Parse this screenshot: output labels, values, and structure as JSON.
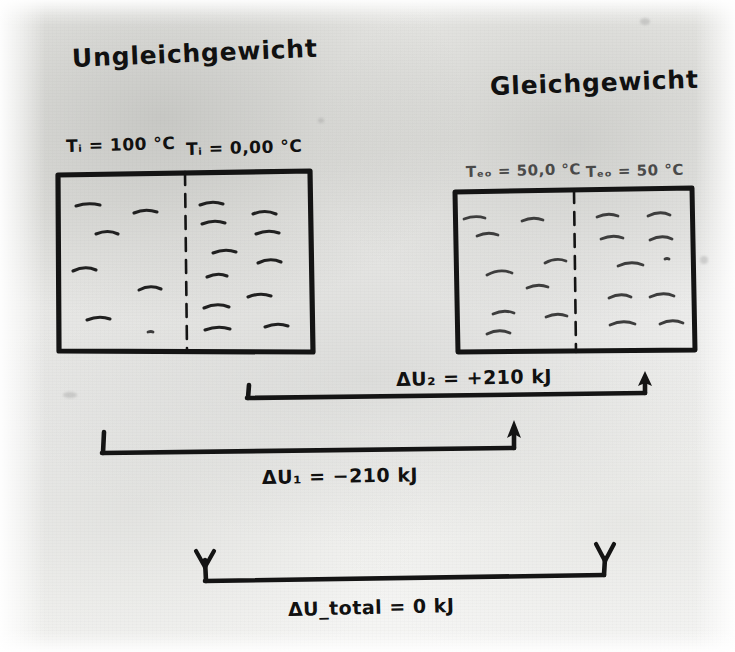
{
  "document": {
    "kind": "handwritten-diagram",
    "language": "de",
    "medium": "scanned pencil-and-pen sketch on grey paper"
  },
  "headings": {
    "left": "Ungleichgewicht",
    "right": "Gleichgewicht"
  },
  "boxes": {
    "left": {
      "name": "non-equilibrium-box",
      "left_half": {
        "temperature_label": "Tᵢ = 100 °C",
        "particle_count": 6,
        "density": "low"
      },
      "right_half": {
        "temperature_label": "Tᵢ = 0,00 °C",
        "particle_count": 11,
        "density": "high"
      },
      "divider": "dashed"
    },
    "right": {
      "name": "equilibrium-box",
      "left_half": {
        "temperature_label": "Tₑₒ = 50,0 °C",
        "particle_count": 9,
        "density": "medium"
      },
      "right_half": {
        "temperature_label": "Tₑₒ = 50 °C",
        "particle_count": 9,
        "density": "medium"
      },
      "divider": "dashed"
    }
  },
  "temperatures": {
    "left_box_left_half": "T",
    "left_box_left_half_sub": "i",
    "left_box_left_half_value": " = 100 ",
    "left_box_left_half_unit": "°C",
    "left_box_right_half_value": " = 0,00 ",
    "right_box_left_half_sub": "eq",
    "right_box_left_half_value": " = 50,0 ",
    "right_box_right_half_value": " = 50 "
  },
  "arrows": [
    {
      "id": "delta-u2",
      "label_delta": "ΔU",
      "label_sub": "2",
      "label_value": " = +210 kJ",
      "full_label": "ΔU₂ = +210 kJ",
      "value": 210,
      "unit": "kJ",
      "sign": "+",
      "direction": "left-to-right",
      "head": "up-arrow-right-end",
      "meaning": "energy gained by the cold subsystem"
    },
    {
      "id": "delta-u1",
      "label_delta": "ΔU",
      "label_sub": "1",
      "label_value": " = −210 kJ",
      "full_label": "ΔU₁ = −210 kJ",
      "value": -210,
      "unit": "kJ",
      "sign": "−",
      "direction": "left-to-right",
      "head": "up-arrow-right-end",
      "meaning": "energy lost by the hot subsystem"
    },
    {
      "id": "delta-u-total",
      "label_delta": "ΔU",
      "label_sub": "total",
      "label_value": " = 0 kJ",
      "full_label": "ΔU_total = 0 kJ",
      "value": 0,
      "unit": "kJ",
      "sign": "",
      "direction": "spanning-both-boxes",
      "head": "down-arrow-both-ends",
      "meaning": "total internal-energy change of the isolated system is zero"
    }
  ],
  "colors": {
    "ink": "#141414",
    "paper": "#e9e9e6",
    "faint_ink": "#4a4a4a"
  }
}
